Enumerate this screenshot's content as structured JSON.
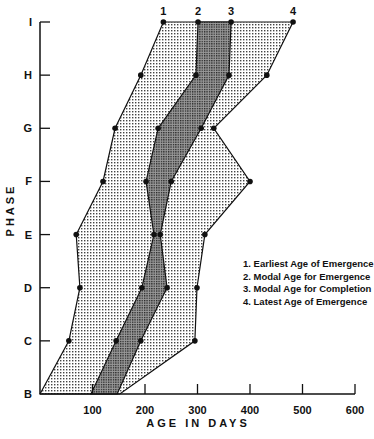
{
  "chart_data": {
    "type": "area",
    "title": "",
    "xlabel": "AGE IN DAYS",
    "ylabel": "PHASE",
    "xlim": [
      0,
      600
    ],
    "xticks": [
      100,
      200,
      300,
      400,
      500,
      600
    ],
    "phases": [
      "B",
      "C",
      "D",
      "E",
      "F",
      "G",
      "H",
      "I"
    ],
    "grid": false,
    "legend_position": "right-middle",
    "series": [
      {
        "id": "1",
        "name": "Earliest Age of Emergence",
        "values": [
          0,
          55,
          76,
          69,
          120,
          143,
          192,
          235
        ]
      },
      {
        "id": "2",
        "name": "Modal Age for Emergence",
        "values": [
          97,
          145,
          194,
          217,
          202,
          225,
          297,
          301
        ]
      },
      {
        "id": "3",
        "name": "Modal Age for Completion",
        "values": [
          147,
          192,
          242,
          229,
          250,
          307,
          360,
          364
        ]
      },
      {
        "id": "4",
        "name": "Latest Age of Emergence",
        "values": [
          152,
          295,
          299,
          314,
          400,
          331,
          432,
          482
        ]
      }
    ],
    "annotations": [
      "1",
      "2",
      "3",
      "4"
    ]
  },
  "legend": {
    "items": [
      "1. Earliest Age of Emergence",
      "2. Modal Age for Emergence",
      "3. Modal Age for Completion",
      "4. Latest Age of Emergence"
    ]
  },
  "axes": {
    "x_title": "AGE IN DAYS",
    "y_title": "PHASE"
  }
}
